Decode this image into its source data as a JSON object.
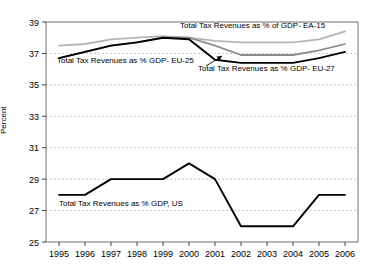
{
  "chart_data": {
    "type": "line",
    "title": "",
    "xlabel": "",
    "ylabel": "Percent",
    "categories": [
      "1995",
      "1996",
      "1997",
      "1998",
      "1999",
      "2000",
      "2001",
      "2002",
      "2003",
      "2004",
      "2005",
      "2006"
    ],
    "ylim": [
      25,
      39
    ],
    "ytick_values": [
      25,
      27,
      29,
      31,
      33,
      35,
      37,
      39
    ],
    "ytick_labels": [
      "25",
      "27",
      "29",
      "31",
      "33",
      "35",
      "37",
      "39"
    ],
    "grid": true,
    "grid_axis": "y",
    "legend": "inline-annotations",
    "series": [
      {
        "name": "Total Tax Revenues as % of GDP- EA-15",
        "color": "#b5b5b5",
        "values": [
          37.5,
          37.6,
          37.9,
          38.0,
          38.1,
          38.0,
          37.8,
          37.7,
          37.7,
          37.7,
          37.9,
          38.4
        ]
      },
      {
        "name": "Total Tax Revenues as % GDP- EU-25",
        "color": "#8c8c8c",
        "values": [
          36.7,
          37.1,
          37.5,
          37.7,
          38.0,
          38.0,
          37.5,
          36.9,
          36.9,
          36.9,
          37.2,
          37.6
        ]
      },
      {
        "name": "Total Tax Revenues as % GDP- EU-27",
        "color": "#000000",
        "values": [
          36.7,
          37.1,
          37.5,
          37.7,
          38.0,
          37.9,
          36.6,
          36.4,
          36.4,
          36.4,
          36.7,
          37.1
        ]
      },
      {
        "name": "Total Tax Revenues as % GDP, US",
        "color": "#000000",
        "values": [
          28.0,
          28.0,
          29.0,
          29.0,
          29.0,
          30.0,
          29.0,
          26.0,
          26.0,
          26.0,
          28.0,
          28.0
        ]
      }
    ],
    "annotations": [
      {
        "id": "ea15",
        "text": "Total Tax Revenues as % of GDP- EA-15",
        "x": 180,
        "y": 28
      },
      {
        "id": "eu25",
        "text": "Total Tax Revenues as % GDP- EU-25",
        "x": 57,
        "y": 63
      },
      {
        "id": "eu27",
        "text": "Total Tax Revenues as % GDP- EU-27",
        "x": 198,
        "y": 71
      },
      {
        "id": "us",
        "text": "Total Tax Revenues as % GDP, US",
        "x": 59,
        "y": 206
      }
    ]
  }
}
